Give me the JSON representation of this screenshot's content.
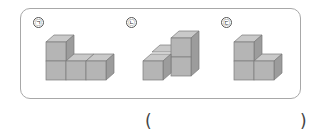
{
  "question": {
    "figures": [
      {
        "label": "㉠",
        "description": "L-shaped block: 3 cubes in a row with 1 cube stacked on the left"
      },
      {
        "label": "㉡",
        "description": "2-cube column on the right with a cube in front-left and one behind"
      },
      {
        "label": "㉢",
        "description": "2-cube column on the left with 1 cube to the right"
      }
    ],
    "answer_open": "(",
    "answer_close": ")"
  },
  "colors": {
    "cube_front": "#b5b5b5",
    "cube_top": "#c9c9c9",
    "cube_side": "#9c9c9c",
    "edge": "#7a7a7a",
    "frame": "#a8a8a8"
  }
}
